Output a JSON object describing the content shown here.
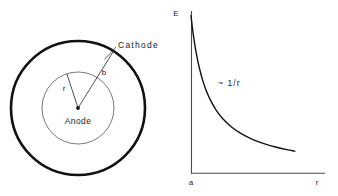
{
  "figure": {
    "background_color": "#ffffff",
    "ink_color": "#1a1a1a",
    "thin_line_color": "#6a6a6a",
    "panels": [
      "cross-section-diagram",
      "field-magnitude-chart"
    ]
  },
  "cross_section": {
    "name": "coaxial-electrode-cross-section",
    "center": {
      "x": 78,
      "y": 108
    },
    "outer_electrode": {
      "label": "Cathode",
      "radius": 67,
      "stroke_width": 2.6,
      "color": "#111111"
    },
    "inner_electrode": {
      "label": "Anode",
      "radius": 36,
      "stroke_width": 0.9,
      "color": "#6a6a6a"
    },
    "center_dot_label": "",
    "radii": [
      {
        "symbol": "r",
        "to": "inner_electrode",
        "angle_deg": 108,
        "label_x": 65,
        "label_y": 90
      },
      {
        "symbol": "b",
        "to": "outer_electrode",
        "angle_deg": 58,
        "label_x": 103,
        "label_y": 74
      }
    ],
    "label_positions": {
      "cathode_x": 118,
      "cathode_y": 48,
      "anode_x": 78,
      "anode_y": 124
    }
  },
  "chart_data": {
    "type": "line",
    "title": "",
    "subtitle": "",
    "xlabel": "r",
    "ylabel": "E",
    "annotation": "~ 1/r",
    "annotation_x": 218,
    "annotation_y": 85,
    "grid": false,
    "legend": null,
    "x_origin_tick_label": "a",
    "axis": {
      "origin_px": {
        "x": 191,
        "y": 173
      },
      "y_top_px": 12,
      "x_right_px": 325,
      "color": "#4a4a4a",
      "stroke_width": 1.1
    },
    "xlim": [
      1,
      9
    ],
    "ylim": [
      0,
      9
    ],
    "x": [
      1.0,
      1.1,
      1.2,
      1.35,
      1.5,
      1.7,
      1.9,
      2.2,
      2.5,
      2.9,
      3.4,
      4.0,
      4.7,
      5.4,
      6.1,
      6.8,
      7.2
    ],
    "values": [
      8.8,
      8.0,
      7.33,
      6.52,
      5.87,
      5.18,
      4.63,
      4.0,
      3.52,
      3.03,
      2.59,
      2.2,
      1.87,
      1.63,
      1.44,
      1.29,
      1.22
    ],
    "series": [
      {
        "name": "E ~ 1/r",
        "color": "#111111",
        "stroke_width": 1.4,
        "x": [
          1.0,
          1.1,
          1.2,
          1.35,
          1.5,
          1.7,
          1.9,
          2.2,
          2.5,
          2.9,
          3.4,
          4.0,
          4.7,
          5.4,
          6.1,
          6.8,
          7.2
        ],
        "values": [
          8.8,
          8.0,
          7.33,
          6.52,
          5.87,
          5.18,
          4.63,
          4.0,
          3.52,
          3.03,
          2.59,
          2.2,
          1.87,
          1.63,
          1.44,
          1.29,
          1.22
        ]
      }
    ]
  }
}
